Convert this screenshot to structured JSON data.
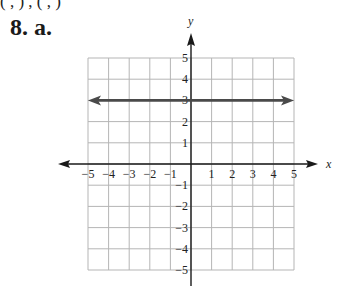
{
  "header": {
    "partial_text": "( ,  )   ,        (  ,  )",
    "problem_label": "8. a."
  },
  "chart_data": {
    "type": "line",
    "title": "",
    "xlabel": "x",
    "ylabel": "y",
    "xlim": [
      -5,
      5
    ],
    "ylim": [
      -5,
      5
    ],
    "grid": true,
    "x_ticks": [
      "-5",
      "-4",
      "-3",
      "-2",
      "-1",
      "1",
      "2",
      "3",
      "4",
      "5"
    ],
    "y_ticks": [
      "5",
      "4",
      "3",
      "2",
      "1",
      "-1",
      "-2",
      "-3",
      "-4",
      "-5"
    ],
    "series": [
      {
        "name": "y = 3",
        "equation": "y = 3",
        "x": [
          -5,
          5
        ],
        "y": [
          3,
          3
        ],
        "arrows_both_ends": true
      }
    ]
  },
  "colors": {
    "grid": "#b5b5b5",
    "axis": "#1a1a1a",
    "line": "#4a4a4a"
  }
}
